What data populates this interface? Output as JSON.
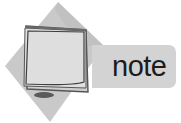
{
  "icon": {
    "semantic": "note-icon",
    "label": "note",
    "colors": {
      "diamond": "#c8c8c8",
      "diamond_shadow": "#b4b4b4",
      "label_bar": "#d3d3d3",
      "paper": "#dcdcdc",
      "paper_border": "#4a4a4a",
      "text": "#1c1c1c"
    }
  }
}
